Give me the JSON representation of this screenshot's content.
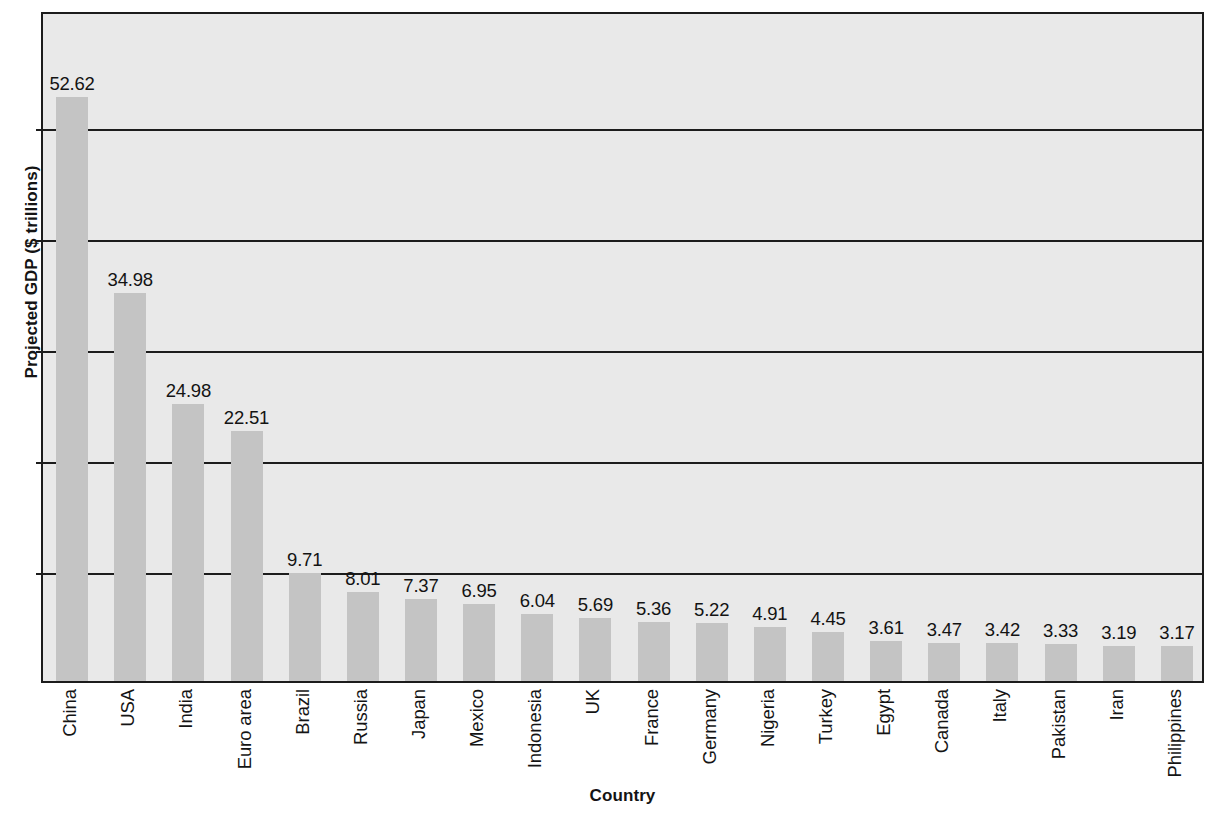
{
  "chart_data": {
    "type": "bar",
    "title": "",
    "xlabel": "Country",
    "ylabel": "Projected GDP ($ trillions)",
    "categories": [
      "China",
      "USA",
      "India",
      "Euro area",
      "Brazil",
      "Russia",
      "Japan",
      "Mexico",
      "Indonesia",
      "UK",
      "France",
      "Germany",
      "Nigeria",
      "Turkey",
      "Egypt",
      "Canada",
      "Italy",
      "Pakistan",
      "Iran",
      "Philippines"
    ],
    "values": [
      52.62,
      34.98,
      24.98,
      22.51,
      9.71,
      8.01,
      7.37,
      6.95,
      6.04,
      5.69,
      5.36,
      5.22,
      4.91,
      4.45,
      3.61,
      3.47,
      3.42,
      3.33,
      3.19,
      3.17
    ],
    "value_labels": [
      "52.62",
      "34.98",
      "24.98",
      "22.51",
      "9.71",
      "8.01",
      "7.37",
      "6.95",
      "6.04",
      "5.69",
      "5.36",
      "5.22",
      "4.91",
      "4.45",
      "3.61",
      "3.47",
      "3.42",
      "3.33",
      "3.19",
      "3.17"
    ],
    "ylim": [
      0,
      60.5
    ],
    "gridline_values": [
      10,
      20,
      30,
      40,
      50
    ],
    "grid": true,
    "legend": "none",
    "bar_color": "#c4c4c4",
    "plot_background": "#e9e9e9",
    "axis_color": "#1c1c1c",
    "text_color": "#141414"
  }
}
